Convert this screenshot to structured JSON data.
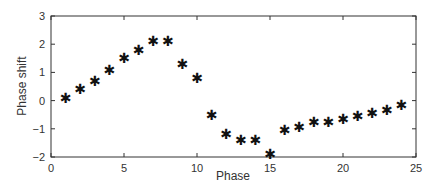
{
  "chart_data": {
    "type": "scatter",
    "title": "",
    "xlabel": "Phase",
    "ylabel": "Phase shift",
    "xlim": [
      0,
      25
    ],
    "ylim": [
      -2,
      3
    ],
    "xticks": [
      0,
      5,
      10,
      15,
      20,
      25
    ],
    "yticks": [
      -2,
      -1,
      0,
      1,
      2,
      3
    ],
    "grid": false,
    "legend": null,
    "marker": "*",
    "marker_color": "#111111",
    "series": [
      {
        "name": "Phase shift",
        "x": [
          1,
          2,
          3,
          4,
          5,
          6,
          7,
          8,
          9,
          10,
          11,
          12,
          13,
          14,
          15,
          16,
          17,
          18,
          19,
          20,
          21,
          22,
          23,
          24
        ],
        "y": [
          0.1,
          0.4,
          0.7,
          1.1,
          1.5,
          1.8,
          2.1,
          2.1,
          1.3,
          0.8,
          -0.5,
          -1.2,
          -1.4,
          -1.4,
          -1.9,
          -1.05,
          -0.95,
          -0.75,
          -0.75,
          -0.65,
          -0.55,
          -0.45,
          -0.35,
          -0.15
        ]
      }
    ]
  }
}
